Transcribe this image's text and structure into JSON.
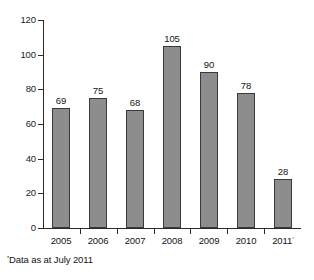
{
  "chart_data": {
    "type": "bar",
    "title": "",
    "subtitle": "",
    "xlabel": "",
    "ylabel": "",
    "categories": [
      "2005",
      "2006",
      "2007",
      "2008",
      "2009",
      "2010",
      "2011"
    ],
    "category_labels": [
      "2005",
      "2006",
      "2007",
      "2008",
      "2009",
      "2010",
      "2011"
    ],
    "category_markers": [
      "",
      "",
      "",
      "",
      "",
      "",
      "ʼ"
    ],
    "values": [
      69,
      75,
      68,
      105,
      90,
      78,
      28
    ],
    "value_labels": [
      "69",
      "75",
      "68",
      "105",
      "90",
      "78",
      "28"
    ],
    "ylim": [
      0,
      120
    ],
    "ytick_values": [
      0,
      20,
      40,
      60,
      80,
      100,
      120
    ],
    "ytick_labels": [
      "0",
      "20",
      "40",
      "60",
      "80",
      "100",
      "120"
    ],
    "grid": false,
    "legend": false,
    "legend_position": "none",
    "bar_color": "#8d8d8d",
    "bar_border_color": "#3a3a3a",
    "axis_color": "#2b2b2b",
    "text_color": "#141414",
    "background": "#ffffff"
  },
  "footnote": {
    "marker": "ʼ",
    "text": "Data as at July 2011",
    "full": "ʼData as at July 2011"
  }
}
